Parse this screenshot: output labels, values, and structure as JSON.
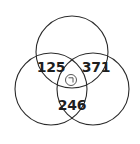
{
  "diagram": {
    "type": "venn",
    "sets": 3,
    "regions": {
      "top_left": "125",
      "top_right": "371",
      "bottom": "246"
    },
    "center_symbol": "circle-with-corner-mark",
    "colors": {
      "stroke": "#2b2b2b",
      "text": "#1e1e1e",
      "background": "#ffffff"
    }
  }
}
